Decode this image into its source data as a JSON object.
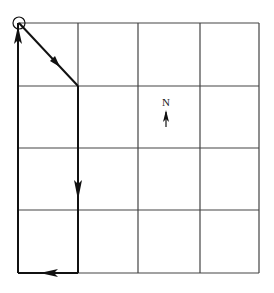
{
  "diagram": {
    "type": "grid-path",
    "grid": {
      "columns": 4,
      "rows": 4,
      "x_lines": [
        18,
        78,
        138,
        200,
        259
      ],
      "y_lines": [
        23,
        86,
        148,
        210,
        273
      ],
      "line_color": "#333333"
    },
    "start_marker": {
      "shape": "circle",
      "cx": 19,
      "cy": 23,
      "r": 6
    },
    "path": [
      {
        "from": [
          19,
          23
        ],
        "to": [
          78,
          86
        ],
        "direction": "southeast"
      },
      {
        "from": [
          78,
          86
        ],
        "to": [
          78,
          273
        ],
        "direction": "south"
      },
      {
        "from": [
          78,
          273
        ],
        "to": [
          18,
          273
        ],
        "direction": "west"
      },
      {
        "from": [
          18,
          273
        ],
        "to": [
          18,
          23
        ],
        "direction": "north"
      }
    ],
    "compass": {
      "label": "N",
      "arrow_direction": "up"
    }
  }
}
